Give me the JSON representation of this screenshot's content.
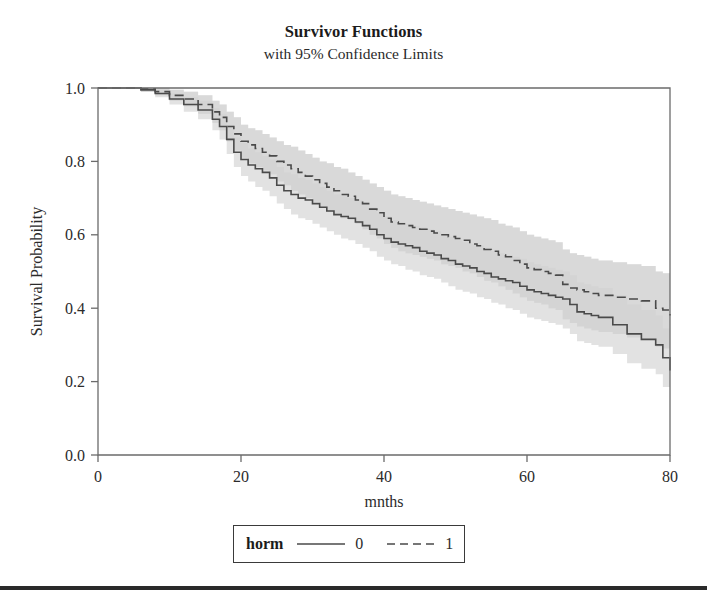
{
  "chart_data": {
    "type": "line",
    "title": "Survivor Functions",
    "subtitle": "with 95% Confidence Limits",
    "xlabel": "mnths",
    "ylabel": "Survival Probability",
    "xlim": [
      0,
      80
    ],
    "ylim": [
      0.0,
      1.0
    ],
    "xticks": [
      0,
      20,
      40,
      60,
      80
    ],
    "xtick_labels": [
      "0",
      "20",
      "40",
      "60",
      "80"
    ],
    "yticks": [
      0.0,
      0.2,
      0.4,
      0.6,
      0.8,
      1.0
    ],
    "ytick_labels": [
      "0.0",
      "0.2",
      "0.4",
      "0.6",
      "0.8",
      "1.0"
    ],
    "grid": false,
    "legend_position": "below-axes",
    "legend_title": "horm",
    "colors": {
      "curve": "#4a4a4a",
      "band_light": "#e2e2e2",
      "band_dark": "#c9c9c9",
      "frame": "#6b6b6b",
      "text": "#2b2b2b",
      "rule": "#2a2a2a"
    },
    "series": [
      {
        "name": "0",
        "legend_label": "0",
        "style": "solid",
        "x": [
          0,
          4,
          6,
          8,
          10,
          12,
          14,
          16,
          17,
          18,
          19,
          20,
          21,
          22,
          23,
          24,
          25,
          26,
          27,
          28,
          29,
          30,
          31,
          32,
          33,
          34,
          35,
          36,
          37,
          38,
          39,
          40,
          41,
          42,
          43,
          44,
          45,
          46,
          47,
          48,
          49,
          50,
          51,
          52,
          53,
          54,
          55,
          56,
          57,
          58,
          59,
          60,
          61,
          62,
          63,
          64,
          65,
          66,
          67,
          68,
          69,
          70,
          72,
          74,
          76,
          78,
          79,
          80
        ],
        "values": [
          1.0,
          1.0,
          0.995,
          0.985,
          0.97,
          0.955,
          0.94,
          0.915,
          0.895,
          0.86,
          0.825,
          0.805,
          0.79,
          0.78,
          0.77,
          0.755,
          0.735,
          0.72,
          0.71,
          0.7,
          0.695,
          0.685,
          0.675,
          0.665,
          0.655,
          0.65,
          0.645,
          0.635,
          0.625,
          0.615,
          0.6,
          0.59,
          0.58,
          0.575,
          0.57,
          0.565,
          0.555,
          0.55,
          0.545,
          0.535,
          0.53,
          0.52,
          0.515,
          0.51,
          0.5,
          0.495,
          0.485,
          0.48,
          0.475,
          0.47,
          0.46,
          0.45,
          0.445,
          0.44,
          0.435,
          0.43,
          0.425,
          0.41,
          0.39,
          0.385,
          0.38,
          0.375,
          0.355,
          0.33,
          0.315,
          0.3,
          0.265,
          0.23
        ],
        "lower": [
          1.0,
          1.0,
          0.99,
          0.975,
          0.955,
          0.935,
          0.915,
          0.885,
          0.86,
          0.82,
          0.785,
          0.76,
          0.745,
          0.73,
          0.72,
          0.705,
          0.685,
          0.67,
          0.655,
          0.645,
          0.64,
          0.63,
          0.62,
          0.61,
          0.6,
          0.59,
          0.585,
          0.575,
          0.565,
          0.555,
          0.54,
          0.53,
          0.52,
          0.515,
          0.505,
          0.5,
          0.49,
          0.485,
          0.48,
          0.47,
          0.46,
          0.45,
          0.445,
          0.44,
          0.43,
          0.425,
          0.415,
          0.41,
          0.4,
          0.395,
          0.385,
          0.375,
          0.37,
          0.365,
          0.36,
          0.355,
          0.345,
          0.33,
          0.31,
          0.305,
          0.3,
          0.295,
          0.275,
          0.25,
          0.235,
          0.22,
          0.185,
          0.15
        ],
        "upper": [
          1.0,
          1.0,
          1.0,
          0.995,
          0.985,
          0.975,
          0.965,
          0.945,
          0.93,
          0.9,
          0.865,
          0.85,
          0.835,
          0.825,
          0.815,
          0.805,
          0.785,
          0.77,
          0.765,
          0.755,
          0.75,
          0.74,
          0.73,
          0.72,
          0.71,
          0.705,
          0.7,
          0.695,
          0.685,
          0.675,
          0.66,
          0.65,
          0.64,
          0.635,
          0.63,
          0.625,
          0.62,
          0.615,
          0.61,
          0.6,
          0.595,
          0.585,
          0.58,
          0.575,
          0.57,
          0.565,
          0.555,
          0.55,
          0.545,
          0.54,
          0.535,
          0.525,
          0.52,
          0.515,
          0.51,
          0.505,
          0.5,
          0.49,
          0.47,
          0.465,
          0.46,
          0.455,
          0.435,
          0.41,
          0.395,
          0.38,
          0.345,
          0.31
        ]
      },
      {
        "name": "1",
        "legend_label": "1",
        "style": "dashed",
        "x": [
          0,
          4,
          6,
          8,
          10,
          12,
          14,
          16,
          17,
          18,
          19,
          20,
          21,
          22,
          23,
          24,
          25,
          26,
          27,
          28,
          29,
          30,
          31,
          32,
          33,
          34,
          35,
          36,
          37,
          38,
          39,
          40,
          41,
          42,
          43,
          44,
          45,
          46,
          47,
          48,
          49,
          50,
          51,
          52,
          53,
          54,
          55,
          56,
          57,
          58,
          59,
          60,
          61,
          62,
          63,
          64,
          65,
          66,
          67,
          68,
          69,
          70,
          72,
          74,
          76,
          78,
          79,
          80
        ],
        "values": [
          1.0,
          1.0,
          0.998,
          0.99,
          0.98,
          0.97,
          0.955,
          0.935,
          0.92,
          0.895,
          0.875,
          0.855,
          0.845,
          0.835,
          0.825,
          0.815,
          0.8,
          0.79,
          0.78,
          0.77,
          0.76,
          0.75,
          0.74,
          0.73,
          0.72,
          0.71,
          0.705,
          0.695,
          0.685,
          0.67,
          0.66,
          0.645,
          0.635,
          0.63,
          0.625,
          0.62,
          0.615,
          0.61,
          0.605,
          0.6,
          0.595,
          0.59,
          0.585,
          0.575,
          0.57,
          0.56,
          0.555,
          0.545,
          0.54,
          0.53,
          0.52,
          0.51,
          0.505,
          0.5,
          0.495,
          0.49,
          0.465,
          0.455,
          0.45,
          0.445,
          0.44,
          0.435,
          0.43,
          0.425,
          0.42,
          0.4,
          0.395,
          0.38
        ],
        "lower": [
          1.0,
          1.0,
          0.99,
          0.98,
          0.965,
          0.95,
          0.93,
          0.905,
          0.885,
          0.855,
          0.83,
          0.81,
          0.795,
          0.785,
          0.775,
          0.765,
          0.745,
          0.735,
          0.72,
          0.71,
          0.7,
          0.69,
          0.675,
          0.665,
          0.655,
          0.645,
          0.64,
          0.63,
          0.615,
          0.6,
          0.59,
          0.575,
          0.565,
          0.555,
          0.55,
          0.545,
          0.54,
          0.535,
          0.53,
          0.52,
          0.515,
          0.51,
          0.5,
          0.495,
          0.485,
          0.475,
          0.47,
          0.46,
          0.45,
          0.44,
          0.43,
          0.42,
          0.415,
          0.41,
          0.4,
          0.395,
          0.37,
          0.36,
          0.35,
          0.345,
          0.34,
          0.335,
          0.33,
          0.32,
          0.315,
          0.295,
          0.29,
          0.275
        ],
        "upper": [
          1.0,
          1.0,
          1.0,
          1.0,
          0.995,
          0.99,
          0.98,
          0.965,
          0.955,
          0.935,
          0.92,
          0.9,
          0.89,
          0.885,
          0.875,
          0.865,
          0.855,
          0.845,
          0.84,
          0.83,
          0.82,
          0.81,
          0.8,
          0.795,
          0.785,
          0.78,
          0.77,
          0.76,
          0.75,
          0.74,
          0.73,
          0.72,
          0.71,
          0.705,
          0.7,
          0.695,
          0.69,
          0.685,
          0.68,
          0.675,
          0.67,
          0.665,
          0.66,
          0.655,
          0.65,
          0.645,
          0.64,
          0.63,
          0.625,
          0.62,
          0.61,
          0.6,
          0.595,
          0.59,
          0.585,
          0.58,
          0.56,
          0.55,
          0.545,
          0.54,
          0.535,
          0.53,
          0.525,
          0.52,
          0.515,
          0.5,
          0.495,
          0.485
        ]
      }
    ]
  },
  "legend": {
    "title": "horm",
    "entries": [
      {
        "label": "0",
        "style": "solid"
      },
      {
        "label": "1",
        "style": "dashed"
      }
    ]
  }
}
